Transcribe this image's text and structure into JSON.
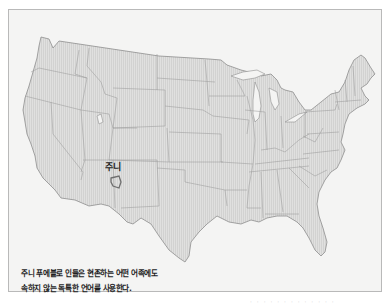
{
  "map": {
    "title": "Continental United States",
    "region_label": "주니",
    "region_marker": "zuni-reservation-outline",
    "colors": {
      "background": "#f4f4f3",
      "land_fill": "#dcdcdc",
      "state_border": "#9a9a9a",
      "frame_border": "#b9b9b9",
      "highlight_outline": "#6f6f6f"
    }
  },
  "caption": {
    "lines": [
      "주니 푸에블로 인들은 현존하는 어떤 어족에도",
      "속하지 않는 독특한 언어를 사용한다."
    ]
  },
  "footer": {
    "text": "· · · · · · · · · · · · ·"
  }
}
